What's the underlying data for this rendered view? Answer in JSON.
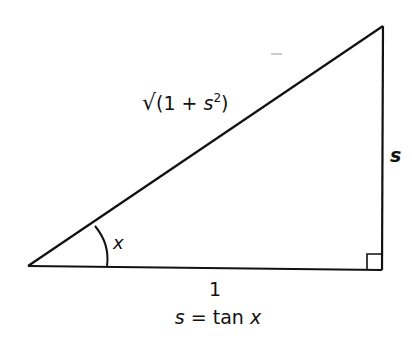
{
  "diagram": {
    "type": "right-triangle",
    "labels": {
      "hypotenuse": "√(1 + s²)",
      "hyp_sqrt": "√",
      "hyp_open": "(1 + ",
      "hyp_s": "s",
      "hyp_sup": "2",
      "hyp_close": ")",
      "opposite": "s",
      "adjacent": "1",
      "angle": "x",
      "caption": "s = tan x",
      "caption_s": "s",
      "caption_mid": " = tan ",
      "caption_x": "x"
    },
    "colors": {
      "stroke": "#111111",
      "background": "#ffffff"
    }
  }
}
